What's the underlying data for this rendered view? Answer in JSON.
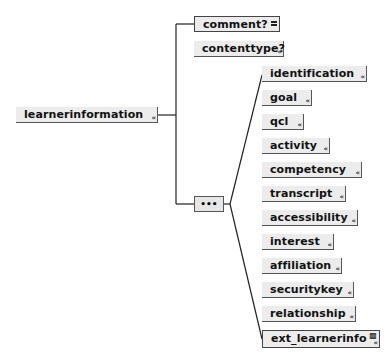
{
  "root": {
    "label": "learnerinformation",
    "expand_glyph": "«"
  },
  "top_children": [
    {
      "label": "comment?",
      "glyph": "="
    },
    {
      "label": "contenttype?",
      "glyph": "«"
    }
  ],
  "sequence": {
    "label": "•••"
  },
  "sequence_children": [
    {
      "label": "identification"
    },
    {
      "label": "goal"
    },
    {
      "label": "qcl"
    },
    {
      "label": "activity"
    },
    {
      "label": "competency"
    },
    {
      "label": "transcript"
    },
    {
      "label": "accessibility"
    },
    {
      "label": "interest"
    },
    {
      "label": "affiliation"
    },
    {
      "label": "securitykey"
    },
    {
      "label": "relationship"
    },
    {
      "label": "ext_learnerinfo"
    }
  ],
  "expand_glyph": "«"
}
